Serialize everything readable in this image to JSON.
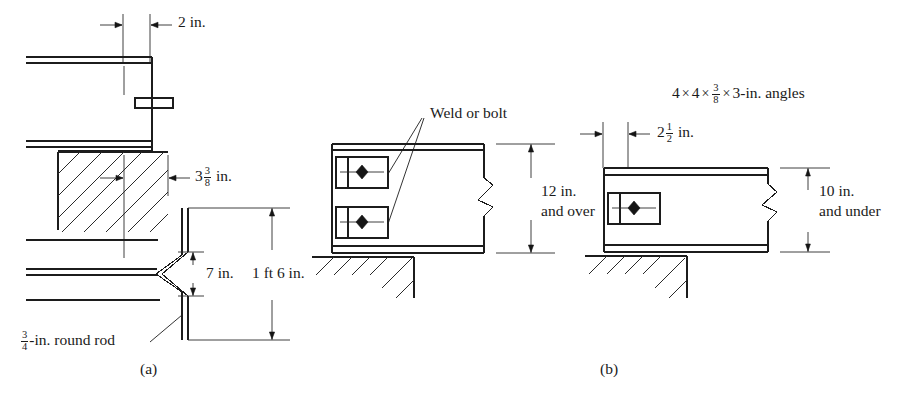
{
  "figure": {
    "type": "engineering-detail-drawing",
    "panels": [
      {
        "id": "a",
        "caption": "(a)",
        "description": "Beam framing into wall with bent plate / round rod anchor detail",
        "annotations": [
          {
            "name": "top-offset",
            "text": "2 in."
          },
          {
            "name": "bearing-offset",
            "text_parts": {
              "whole": "3",
              "num": "3",
              "den": "8",
              "unit": "in."
            }
          },
          {
            "name": "rod-spacing",
            "text": "7 in."
          },
          {
            "name": "overall-depth",
            "text": "1 ft 6 in."
          },
          {
            "name": "round-rod",
            "text_parts": {
              "num": "3",
              "den": "4",
              "tail": "-in. round rod"
            }
          }
        ]
      },
      {
        "id": "b-left",
        "caption": "",
        "description": "Beam 12 in. and over seated on wall with two connection angles",
        "annotations": [
          {
            "name": "weld-or-bolt",
            "text": "Weld or bolt"
          },
          {
            "name": "depth-line-1",
            "text": "12 in."
          },
          {
            "name": "depth-line-2",
            "text": "and over"
          }
        ]
      },
      {
        "id": "b",
        "caption": "(b)",
        "description": "Beam 10 in. and under seated on wall with single connection angle",
        "annotations": [
          {
            "name": "angle-spec",
            "text_parts": {
              "a": "4",
              "b": "4",
              "num": "3",
              "den": "8",
              "c": "3-in. angles"
            }
          },
          {
            "name": "edge-distance",
            "text_parts": {
              "whole": "2",
              "num": "1",
              "den": "2",
              "unit": "in."
            }
          },
          {
            "name": "depth-line-1",
            "text": "10 in."
          },
          {
            "name": "depth-line-2",
            "text": "and under"
          }
        ]
      }
    ],
    "labels": {
      "two_in": "2 in.",
      "three_and_three_eighths": {
        "whole": "3",
        "num": "3",
        "den": "8",
        "unit": "in."
      },
      "seven_in": "7 in.",
      "one_ft_six_in": "1 ft 6 in.",
      "round_rod": {
        "num": "3",
        "den": "4",
        "tail": "-in. round rod"
      },
      "caption_a": "(a)",
      "weld_or_bolt": "Weld or bolt",
      "twelve_in": "12 in.",
      "and_over": "and over",
      "angle_spec": {
        "a": "4",
        "b": "4",
        "num": "3",
        "den": "8",
        "c": "3-in. angles"
      },
      "two_and_half": {
        "whole": "2",
        "num": "1",
        "den": "2",
        "unit": "in."
      },
      "ten_in": "10 in.",
      "and_under": "and under",
      "caption_b": "(b)",
      "times_symbol": "×"
    },
    "colors": {
      "line": "#1c1c1c",
      "text": "#1a1a1a",
      "background": "#ffffff",
      "bolt_fill": "#151515"
    }
  }
}
